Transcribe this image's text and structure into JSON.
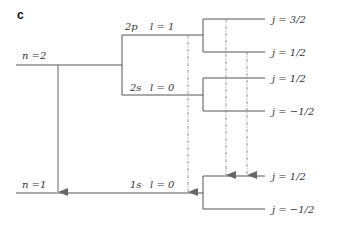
{
  "panel_label": "c",
  "levels": {
    "n2": {
      "label": "n =2"
    },
    "n1": {
      "label": "n =1"
    },
    "p2": {
      "orbital": "2p",
      "l": "l = 1"
    },
    "s2": {
      "orbital": "2s",
      "l": "l = 0"
    },
    "s1": {
      "orbital": "1s",
      "l": "l = 0"
    }
  },
  "j_levels": {
    "p2_upper": "j = 3/2",
    "p2_lower": "j = 1/2",
    "s2_upper": "j = 1/2",
    "s2_lower": "j = −1/2",
    "s1_upper": "j = 1/2",
    "s1_lower": "j = −1/2"
  },
  "colors": {
    "line": "#555555",
    "arrow": "#666666",
    "text": "#333333"
  }
}
